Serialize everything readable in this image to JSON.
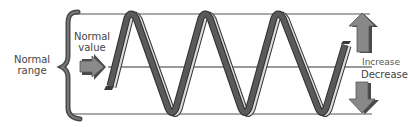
{
  "diagram": {
    "labels": {
      "normal_range": "Normal\nrange",
      "normal_range_line1": "Normal",
      "normal_range_line2": "range",
      "normal_value_line1": "Normal",
      "normal_value_line2": "value",
      "increase": "Increase",
      "decrease": "Decrease"
    },
    "reference_lines": {
      "upper_limit_y": 14,
      "normal_value_y": 67,
      "lower_limit_y": 114
    },
    "wave": {
      "cycles": 3,
      "description": "Ribbon-like wave oscillating between upper and lower limits of the normal range, crossing the normal value line"
    },
    "arrows": {
      "normal_value_arrow": "right-pointing arrow indicating normal value",
      "increase_arrow": "up-pointing arrow",
      "decrease_arrow": "down-pointing arrow"
    },
    "colors": {
      "ribbon_dark": "#555555",
      "ribbon_light": "#d9d9d9",
      "ribbon_outline": "#333333",
      "arrow_fill": "#777777",
      "arrow_shadow": "#4a4a4a",
      "brace": "#555555",
      "line": "#444444",
      "text": "#444444"
    }
  }
}
